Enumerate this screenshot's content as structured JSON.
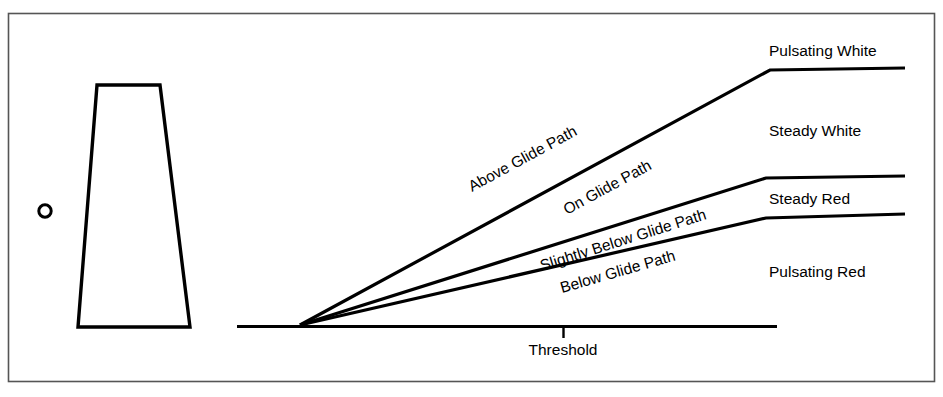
{
  "figure": {
    "type": "diagram",
    "colors": {
      "ink": "#000000",
      "background": "#ffffff",
      "border": "#555555"
    }
  },
  "border": {
    "x": 8,
    "y": 13,
    "width": 927,
    "height": 369
  },
  "runway": {
    "name": "runway-perspective-trapezoid",
    "top_left_x": 97,
    "top_right_x": 160,
    "top_y": 85,
    "bottom_left_x": 78,
    "bottom_right_x": 190,
    "bottom_y": 327
  },
  "aircraft_marker": {
    "name": "aircraft-position-circle",
    "cx": 45,
    "cy": 211,
    "r": 6.5
  },
  "ground": {
    "name": "ground-line",
    "x1": 237,
    "x2": 777,
    "y": 326,
    "apex_x": 300,
    "apex_y": 325,
    "tick_x": 563,
    "tick_y1": 326,
    "tick_y2": 337
  },
  "rays": [
    {
      "id": "ray-above",
      "label_above": "Above Glide Path",
      "label_below": "On Glide Path",
      "bend_x": 770,
      "bend_y": 70,
      "end_x": 905,
      "end_y": 68
    },
    {
      "id": "ray-slightly-below",
      "label_above": "Slightly Below Glide Path",
      "bend_x": 766,
      "bend_y": 178,
      "end_x": 905,
      "end_y": 176
    },
    {
      "id": "ray-below",
      "label_above": "Below Glide Path",
      "bend_x": 766,
      "bend_y": 218,
      "end_x": 905,
      "end_y": 214
    }
  ],
  "ray_labels": {
    "above_glide_path": "Above Glide Path",
    "on_glide_path": "On Glide Path",
    "slightly_below_glide_path": "Slightly Below Glide Path",
    "below_glide_path": "Below Glide Path"
  },
  "zone_labels": {
    "pulsating_white": "Pulsating White",
    "steady_white": "Steady White",
    "steady_red": "Steady Red",
    "pulsating_red": "Pulsating Red"
  },
  "ground_label": {
    "threshold": "Threshold"
  }
}
